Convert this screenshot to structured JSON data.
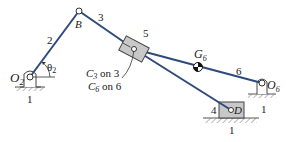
{
  "colors": {
    "link": "#2e4a7a",
    "ground": "#555555",
    "slider_fill": "#c8c8c8",
    "text": "#1a1a1a",
    "background": "#ffffff"
  },
  "labels": {
    "O2": "O",
    "O2_sub": "2",
    "theta": "θ",
    "theta_sub": "2",
    "B": "B",
    "G6": "G",
    "G6_sub": "6",
    "O6": "O",
    "O6_sub": "6",
    "D": "D",
    "link_1_left": "1",
    "link_1_right": "1",
    "link_1_bottom": "1",
    "link_2": "2",
    "link_3": "3",
    "link_4": "4",
    "link_5": "5",
    "link_6": "6",
    "note_line1_main": "C",
    "note_line1_sub": "3",
    "note_line1_rest": " on 3",
    "note_line2_main": "C",
    "note_line2_sub": "6",
    "note_line2_rest": " on 6"
  }
}
